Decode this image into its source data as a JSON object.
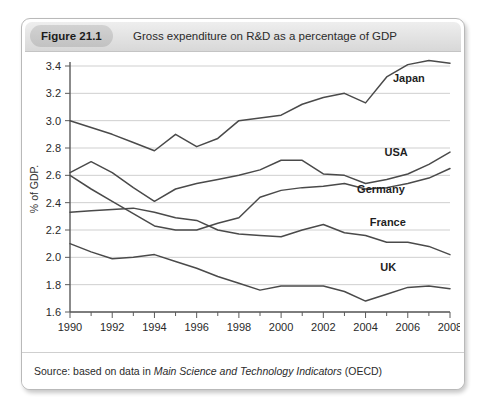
{
  "figure": {
    "badge": "Figure 21.1",
    "title": "Gross expenditure on R&D as a percentage of GDP",
    "source_prefix": "Source: based on data in ",
    "source_italic": "Main Science and Technology Indicators",
    "source_suffix": " (OECD)"
  },
  "colors": {
    "card_border": "#b9b9b9",
    "header_band": "#e3e3e3",
    "badge": "#c8c8c8",
    "gridline": "#cfcfcf",
    "axis": "#5a5a5a",
    "series_line": "#4a4a4a",
    "text": "#2b2b2b"
  },
  "chart_data": {
    "type": "line",
    "title": "Gross expenditure on R&D as a percentage of GDP",
    "xlabel": "",
    "ylabel": "% of GDP.",
    "xlim": [
      1990,
      2008
    ],
    "ylim": [
      1.6,
      3.4
    ],
    "ytick_step": 0.2,
    "grid": true,
    "legend_position": "inline-right",
    "x": [
      1990,
      1991,
      1992,
      1993,
      1994,
      1995,
      1996,
      1997,
      1998,
      1999,
      2000,
      2001,
      2002,
      2003,
      2004,
      2005,
      2006,
      2007,
      2008
    ],
    "xticks": [
      1990,
      1992,
      1994,
      1996,
      1998,
      2000,
      2002,
      2004,
      2006,
      2008
    ],
    "xtick_labels": [
      "1990",
      "1992",
      "1994",
      "1996",
      "1998",
      "2000",
      "2002",
      "2004",
      "2006",
      "2008"
    ],
    "yticks": [
      1.6,
      1.8,
      2.0,
      2.2,
      2.4,
      2.6,
      2.8,
      3.0,
      3.2,
      3.4
    ],
    "ytick_labels": [
      "1.6",
      "1.8",
      "2.0",
      "2.2",
      "2.4",
      "2.6",
      "2.8",
      "3.0",
      "3.2",
      "3.4"
    ],
    "series": [
      {
        "name": "Japan",
        "label": "Japan",
        "label_x": 2005.3,
        "label_y": 3.28,
        "values": [
          3.0,
          2.95,
          2.9,
          2.84,
          2.78,
          2.9,
          2.81,
          2.87,
          3.0,
          3.02,
          3.04,
          3.12,
          3.17,
          3.2,
          3.13,
          3.32,
          3.41,
          3.44,
          3.42
        ]
      },
      {
        "name": "USA",
        "label": "USA",
        "label_x": 2004.9,
        "label_y": 2.74,
        "values": [
          2.62,
          2.7,
          2.62,
          2.51,
          2.41,
          2.5,
          2.54,
          2.57,
          2.6,
          2.64,
          2.71,
          2.71,
          2.61,
          2.6,
          2.54,
          2.57,
          2.61,
          2.68,
          2.77
        ]
      },
      {
        "name": "Germany",
        "label": "Germany",
        "label_x": 2003.6,
        "label_y": 2.47,
        "values": [
          2.6,
          2.5,
          2.41,
          2.32,
          2.23,
          2.2,
          2.2,
          2.25,
          2.29,
          2.44,
          2.49,
          2.51,
          2.52,
          2.54,
          2.5,
          2.51,
          2.54,
          2.58,
          2.65
        ]
      },
      {
        "name": "France",
        "label": "France",
        "label_x": 2004.2,
        "label_y": 2.23,
        "values": [
          2.33,
          2.34,
          2.35,
          2.36,
          2.33,
          2.29,
          2.27,
          2.2,
          2.17,
          2.16,
          2.15,
          2.2,
          2.24,
          2.18,
          2.16,
          2.11,
          2.11,
          2.08,
          2.02
        ]
      },
      {
        "name": "UK",
        "label": "UK",
        "label_x": 2004.7,
        "label_y": 1.9,
        "values": [
          2.1,
          2.04,
          1.99,
          2.0,
          2.02,
          1.97,
          1.92,
          1.86,
          1.81,
          1.76,
          1.79,
          1.79,
          1.79,
          1.75,
          1.68,
          1.73,
          1.78,
          1.79,
          1.77
        ]
      }
    ]
  }
}
